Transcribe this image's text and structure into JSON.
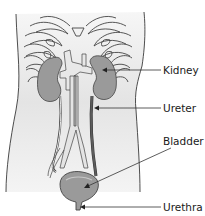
{
  "colors": {
    "torso_fill": "#ececec",
    "outline": "#3a3a3a",
    "organ_fill": "#9a9a9a",
    "vessel_fill": "#e2e2e2",
    "dark_vessel": "#5c5c5c",
    "leader_line": "#333333"
  },
  "labels": [
    {
      "id": "kidney",
      "text": "Kidney",
      "x": 163,
      "y": 65
    },
    {
      "id": "ureter",
      "text": "Ureter",
      "x": 163,
      "y": 103
    },
    {
      "id": "bladder",
      "text": "Bladder",
      "x": 163,
      "y": 136
    },
    {
      "id": "urethra",
      "text": "Urethra",
      "x": 163,
      "y": 202
    }
  ],
  "leaders": [
    {
      "id": "kidney",
      "x1": 161,
      "y1": 70,
      "x2": 104,
      "y2": 70
    },
    {
      "id": "ureter",
      "x1": 161,
      "y1": 108,
      "x2": 96,
      "y2": 108
    },
    {
      "id": "bladder",
      "x1": 171,
      "y1": 148,
      "x2": 86,
      "y2": 187
    },
    {
      "id": "urethra",
      "x1": 161,
      "y1": 207,
      "x2": 81,
      "y2": 207
    }
  ]
}
